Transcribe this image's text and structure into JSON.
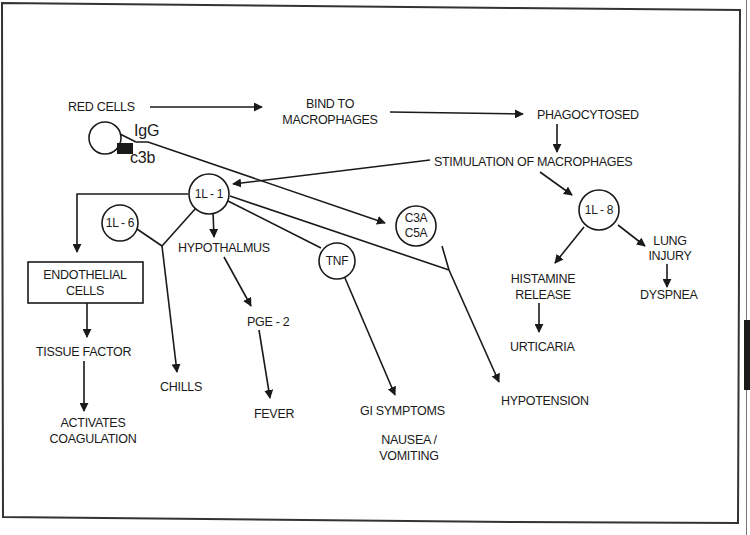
{
  "diagram": {
    "colors": {
      "ink": "#1a1a1a",
      "background": "#ffffff",
      "frame": "#333333"
    },
    "labels": {
      "red_cells": "RED CELLS",
      "igg": "IgG",
      "c3b": "c3b",
      "bind_1": "BIND TO",
      "bind_2": "MACROPHAGES",
      "phagocytosed": "PHAGOCYTOSED",
      "stimulation": "STIMULATION OF MACROPHAGES",
      "il1": "1L - 1",
      "il6": "1L - 6",
      "il8": "1L - 8",
      "c3a": "C3A",
      "c5a": "C5A",
      "tnf": "TNF",
      "hypothalmus": "HYPOTHALMUS",
      "pge2": "PGE - 2",
      "fever": "FEVER",
      "endothelial_1": "ENDOTHELIAL",
      "endothelial_2": "CELLS",
      "tissue_factor": "TISSUE FACTOR",
      "activates_1": "ACTIVATES",
      "activates_2": "COAGULATION",
      "chills": "CHILLS",
      "gi_symptoms": "GI SYMPTOMS",
      "nausea_1": "NAUSEA /",
      "nausea_2": "VOMITING",
      "hypotension": "HYPOTENSION",
      "histamine_1": "HISTAMINE",
      "histamine_2": "RELEASE",
      "urticaria": "URTICARIA",
      "lung_1": "LUNG",
      "lung_2": "INJURY",
      "dyspnea": "DYSPNEA"
    },
    "icons": {
      "red_cell": "circle-icon",
      "c3b_marker": "filled-square-icon",
      "arrowhead": "triangle-arrow-icon"
    }
  }
}
